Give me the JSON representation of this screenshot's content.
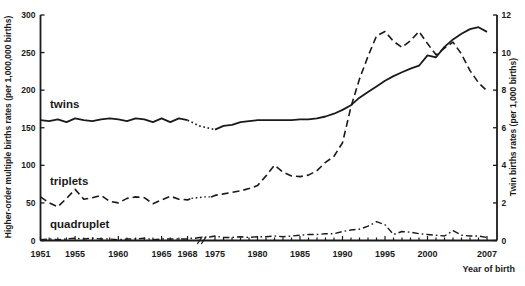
{
  "figure": {
    "background": "#ffffff",
    "ink_color": "#1a1a1a"
  },
  "chart_data": {
    "type": "line",
    "title": "",
    "xlabel": "Year of birth",
    "ylabel_left": "Higher-order multiple births rates (per 1,000,000 births)",
    "ylabel_right": "Twin births rates (per 1,000 births)",
    "left_axis": {
      "min": 0,
      "max": 300,
      "ticks": [
        0,
        50,
        100,
        150,
        200,
        250,
        300
      ]
    },
    "right_axis": {
      "min": 0,
      "max": 12,
      "ticks": [
        0,
        2,
        4,
        6,
        8,
        10,
        12
      ]
    },
    "x_tick_labels": [
      1951,
      1955,
      1960,
      1965,
      1968,
      1975,
      1980,
      1985,
      1990,
      1995,
      2000,
      2007
    ],
    "axis_break": {
      "between": [
        1968,
        1975
      ]
    },
    "grid": false,
    "legend": "inline-labels",
    "x": [
      1951,
      1952,
      1953,
      1954,
      1955,
      1956,
      1957,
      1958,
      1959,
      1960,
      1961,
      1962,
      1963,
      1964,
      1965,
      1966,
      1967,
      1968,
      1969,
      1970,
      1971,
      1972,
      1973,
      1974,
      1975,
      1976,
      1977,
      1978,
      1979,
      1980,
      1981,
      1982,
      1983,
      1984,
      1985,
      1986,
      1987,
      1988,
      1989,
      1990,
      1991,
      1992,
      1993,
      1994,
      1995,
      1996,
      1997,
      1998,
      1999,
      2000,
      2001,
      2002,
      2003,
      2004,
      2005,
      2006,
      2007
    ],
    "series": [
      {
        "name": "twins",
        "axis": "right",
        "style": "solid",
        "dotted_span": [
          1968,
          1975
        ],
        "values": [
          6.4,
          6.35,
          6.45,
          6.3,
          6.5,
          6.4,
          6.35,
          6.45,
          6.5,
          6.45,
          6.35,
          6.5,
          6.45,
          6.3,
          6.5,
          6.3,
          6.5,
          6.4,
          6.3,
          6.2,
          6.1,
          6.05,
          6.0,
          5.95,
          5.9,
          6.1,
          6.15,
          6.3,
          6.35,
          6.4,
          6.4,
          6.4,
          6.4,
          6.4,
          6.45,
          6.45,
          6.5,
          6.6,
          6.75,
          6.95,
          7.2,
          7.6,
          7.9,
          8.2,
          8.5,
          8.75,
          8.95,
          9.15,
          9.3,
          9.85,
          9.75,
          10.3,
          10.7,
          11.0,
          11.25,
          11.35,
          11.1
        ]
      },
      {
        "name": "triplets",
        "axis": "left",
        "style": "dashed",
        "dotted_span": [
          1969,
          1974
        ],
        "values": [
          58,
          50,
          45,
          56,
          68,
          55,
          57,
          60,
          52,
          50,
          56,
          58,
          57,
          49,
          54,
          59,
          55,
          54,
          56,
          57,
          57,
          58,
          58,
          58,
          60,
          62,
          64,
          66,
          69,
          73,
          86,
          100,
          91,
          86,
          85,
          87,
          93,
          104,
          112,
          130,
          178,
          215,
          245,
          272,
          278,
          265,
          257,
          266,
          278,
          262,
          247,
          256,
          264,
          248,
          226,
          210,
          199
        ]
      },
      {
        "name": "quadruplet",
        "axis": "left",
        "style": "dashdot",
        "dotted_span": null,
        "values": [
          1,
          2,
          1,
          2,
          3,
          2,
          3,
          2,
          2,
          1,
          2,
          2,
          3,
          1,
          2,
          2,
          2,
          2,
          3,
          3,
          4,
          4,
          4,
          5,
          6,
          4,
          4,
          5,
          4,
          5,
          5,
          6,
          5,
          6,
          7,
          8,
          8,
          9,
          9,
          12,
          14,
          15,
          19,
          25,
          21,
          8,
          12,
          11,
          9,
          8,
          7,
          6,
          13,
          7,
          6,
          6,
          4
        ]
      }
    ]
  }
}
